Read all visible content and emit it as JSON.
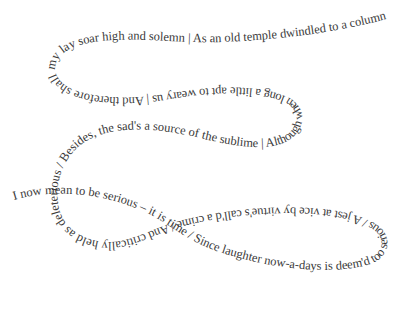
{
  "figure": {
    "kind": "text-on-path typography",
    "background_color": "#ffffff",
    "text_color": "#3a3a3a",
    "poem_text": "I now mean to be serious – it is time / Since laughter now-a-days is deem'd too serious / A jest at vice by virtue's call'd a crime / And critically held as deleterious / Besides, the sad's a source of the sublime | Although when long a little apt to weary us | And therefore shall my lay soar high and solemn | As an old temple dwindled to a column",
    "lines": [
      "I now mean to be serious – it is time",
      "Since laughter now-a-days is deem'd too serious",
      "A jest at vice by virtue's call'd a crime",
      "And critically held as deleterious",
      "Besides, the sad's a source of the sublime",
      "Although when long a little apt to weary us",
      "And therefore shall my lay soar high and solemn",
      "As an old temple dwindled to a column"
    ]
  }
}
